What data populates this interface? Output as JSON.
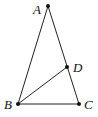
{
  "diagram": {
    "type": "triangle-with-cevian",
    "points": {
      "A": {
        "label": "A",
        "x": 48,
        "y": 6,
        "label_x": 33,
        "label_y": 14
      },
      "B": {
        "label": "B",
        "x": 18,
        "y": 104,
        "label_x": 4,
        "label_y": 109
      },
      "C": {
        "label": "C",
        "x": 79,
        "y": 104,
        "label_x": 84,
        "label_y": 109
      },
      "D": {
        "label": "D",
        "x": 67,
        "y": 67,
        "label_x": 73,
        "label_y": 72
      }
    },
    "segments": [
      {
        "from": "A",
        "to": "B"
      },
      {
        "from": "A",
        "to": "C"
      },
      {
        "from": "B",
        "to": "C"
      },
      {
        "from": "B",
        "to": "D"
      }
    ],
    "colors": {
      "stroke": "#222222",
      "point": "#111111",
      "background": "#ffffff"
    }
  }
}
